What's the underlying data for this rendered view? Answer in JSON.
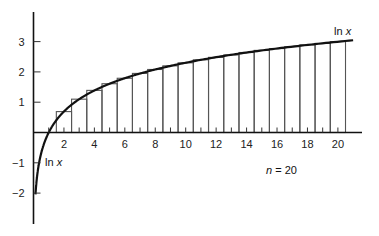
{
  "chart_data": {
    "type": "line",
    "title": "",
    "xlabel": "",
    "ylabel": "",
    "xlim": [
      0,
      21.5
    ],
    "ylim": [
      -3.5,
      3.9
    ],
    "x_ticks": [
      2,
      4,
      6,
      8,
      10,
      12,
      14,
      16,
      18,
      20
    ],
    "x_minor_ticks": [
      1,
      3,
      5,
      7,
      9,
      11,
      13,
      15,
      17,
      19
    ],
    "y_ticks": [
      -2,
      -1,
      1,
      2,
      3
    ],
    "grid": false,
    "series": [
      {
        "name": "ln x",
        "kind": "curve",
        "function": "ln(x)",
        "x_range": [
          0.13,
          21
        ]
      },
      {
        "name": "midpoint rectangles",
        "kind": "bars",
        "width": 1,
        "centers": [
          2,
          3,
          4,
          5,
          6,
          7,
          8,
          9,
          10,
          11,
          12,
          13,
          14,
          15,
          16,
          17,
          18,
          19,
          20
        ],
        "values": [
          0.69,
          1.1,
          1.39,
          1.61,
          1.79,
          1.95,
          2.08,
          2.2,
          2.3,
          2.4,
          2.48,
          2.56,
          2.64,
          2.71,
          2.77,
          2.83,
          2.89,
          2.94,
          3.0
        ]
      }
    ],
    "annotations": [
      {
        "text": "ln x",
        "x": 20.6,
        "y": 3.25,
        "italic_part": "x"
      },
      {
        "text": "ln x",
        "x": 0.9,
        "y": -0.95,
        "italic_part": "x"
      },
      {
        "text": "n = 20",
        "x": 16.2,
        "y": -1.75,
        "italic_part": "n"
      }
    ]
  },
  "labels": {
    "curve_label_top_fn": "ln",
    "curve_label_top_var": "x",
    "curve_label_left_fn": "ln",
    "curve_label_left_var": "x",
    "n_var": "n",
    "n_value": " = 20"
  }
}
